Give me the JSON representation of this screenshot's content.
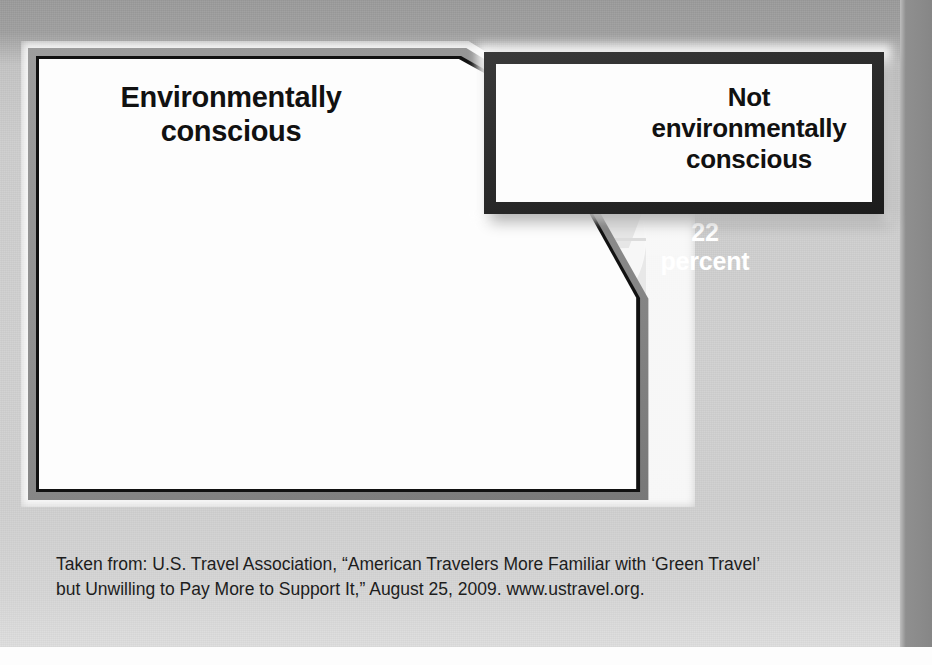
{
  "chart_data": {
    "type": "pie",
    "title": "",
    "subtitle": "",
    "categories": [
      "Environmentally conscious",
      "Not environmentally conscious"
    ],
    "values": [
      78,
      22
    ],
    "unit": "percent",
    "data_labels": [
      "78 percent",
      "22 percent"
    ],
    "legend_position": "callout-boxes",
    "grid": false,
    "three_d": true,
    "colors": {
      "slice_environmentally_conscious": "#d3d3d3",
      "slice_not_environmentally_conscious": "#5d5d5d",
      "cylinder_side": "#8e8e8e",
      "page_background": "#cfcfcf",
      "label_text_dark": "#111111",
      "label_text_light": "#ffffff",
      "right_box_border": "#262626",
      "left_box_border": "#8f8f8f"
    },
    "annotations": [
      {
        "text": "Environmentally conscious",
        "points_to": "78 percent slice"
      },
      {
        "text": "Not environmentally conscious",
        "points_to": "22 percent slice"
      }
    ]
  },
  "callouts": {
    "left": {
      "label_line1": "Environmentally",
      "label_line2": "conscious"
    },
    "right": {
      "label_line1": "Not",
      "label_line2": "environmentally",
      "label_line3": "conscious"
    }
  },
  "pie": {
    "label_major": "78 percent",
    "label_minor_line1": "22",
    "label_minor_line2": "percent"
  },
  "caption": {
    "line1": "Taken from: U.S. Travel Association, “American Travelers More Familiar with ‘Green Travel’",
    "line2": "but Unwilling to Pay More to Support It,” August 25, 2009. www.ustravel.org."
  }
}
